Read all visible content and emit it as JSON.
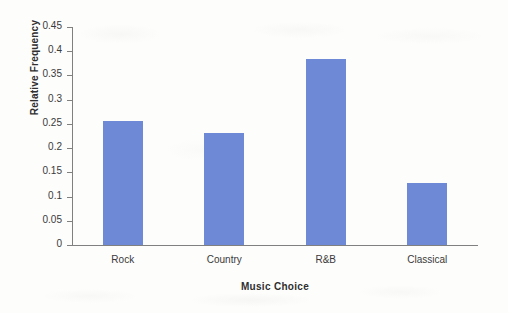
{
  "chart_data": {
    "type": "bar",
    "title": "",
    "xlabel": "Music Choice",
    "ylabel": "Relative Frequency",
    "categories": [
      "Rock",
      "Country",
      "R&B",
      "Classical"
    ],
    "values": [
      0.256,
      0.231,
      0.385,
      0.128
    ],
    "ylim": [
      0,
      0.45
    ],
    "ytick_labels": [
      "0",
      "0.05",
      "0.1",
      "0.15",
      "0.2",
      "0.25",
      "0.3",
      "0.35",
      "0.4",
      "0.45"
    ],
    "ytick_values": [
      0,
      0.05,
      0.1,
      0.15,
      0.2,
      0.25,
      0.3,
      0.35,
      0.4,
      0.45
    ],
    "grid": false,
    "legend": null,
    "bar_color": "#6E8AD6",
    "axis_color": "#808080"
  }
}
